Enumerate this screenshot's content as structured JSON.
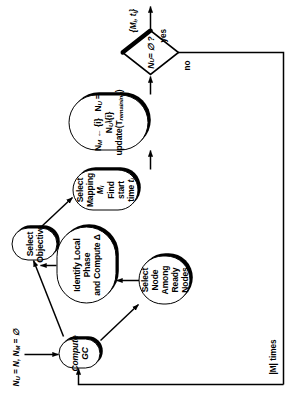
{
  "figure": {
    "kind": "flowchart",
    "orientation": "rotated-90-ccw",
    "background": "#ffffff",
    "line_color": "#000000"
  },
  "labels": {
    "init": "N<sub>U</sub> = N, N<sub>M</sub> = ∅",
    "loop_count": "|M| times",
    "branch_no": "no",
    "branch_yes": "yes",
    "output": "{M<sub>i</sub>, t<sub>i</sub>}"
  },
  "nodes": [
    {
      "id": "compute-gc",
      "name": "compute-gc-node",
      "shape": "stadium",
      "lines": [
        "Compute <i>GC</i>"
      ]
    },
    {
      "id": "select-node",
      "name": "select-node-among-ready-nodes-node",
      "shape": "stadium",
      "lines": [
        "Select Node",
        "Among Ready",
        "Nodes"
      ]
    },
    {
      "id": "identify-local-phase",
      "name": "identify-local-phase-node",
      "shape": "stadium",
      "lines": [
        "Identify Local Phase",
        "and Compute Δ"
      ]
    },
    {
      "id": "select-objective",
      "name": "select-objective-node",
      "shape": "stadium",
      "lines": [
        "Select",
        "Objective"
      ]
    },
    {
      "id": "select-mapping",
      "name": "select-mapping-node",
      "shape": "stadium",
      "lines": [
        "Select Mapping <i>M<sub>i</sub></i>",
        "Find start time <i>t<sub>i</sub></i>"
      ]
    },
    {
      "id": "update-sets",
      "name": "update-sets-node",
      "shape": "stadium",
      "lines": [
        "N<sub>M</sub> ← {i}&nbsp;&nbsp; N<sub>U</sub> = N<sub>U</sub>\\{i}",
        "update(T<sub>remaining</sub>)"
      ]
    },
    {
      "id": "decision",
      "name": "empty-check-decision",
      "shape": "diamond",
      "lines": [
        "N<sub>U</sub> = ∅ ?"
      ]
    }
  ],
  "edges": [
    {
      "from": "start",
      "to": "compute-gc",
      "name": "edge-start-to-compute-gc"
    },
    {
      "from": "feedback",
      "to": "compute-gc",
      "name": "edge-feedback-to-compute-gc"
    },
    {
      "from": "compute-gc",
      "to": "select-node",
      "name": "edge-compute-gc-to-select-node"
    },
    {
      "from": "compute-gc",
      "to": "select-objective",
      "name": "edge-compute-gc-to-select-objective"
    },
    {
      "from": "select-node",
      "to": "identify-local-phase",
      "name": "edge-select-node-to-identify-local-phase"
    },
    {
      "from": "identify-local-phase",
      "to": "select-objective",
      "name": "edge-identify-local-phase-to-select-objective"
    },
    {
      "from": "select-objective",
      "to": "select-mapping",
      "name": "edge-select-objective-to-select-mapping"
    },
    {
      "from": "select-mapping",
      "to": "update-sets",
      "name": "edge-select-mapping-to-update-sets"
    },
    {
      "from": "update-sets",
      "to": "decision",
      "name": "edge-update-sets-to-decision"
    },
    {
      "from": "decision",
      "to": "output",
      "name": "edge-decision-yes-to-output"
    },
    {
      "from": "decision",
      "to": "feedback",
      "name": "edge-decision-no-to-feedback"
    }
  ]
}
